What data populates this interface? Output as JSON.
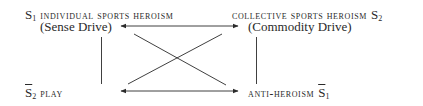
{
  "diagram": {
    "type": "semiotic-square",
    "nodes": {
      "top_left": {
        "symbol": "S",
        "subscript": "1",
        "negated": false,
        "label": "INDIVIDUAL SPORTS HEROISM",
        "sublabel": "(Sense Drive)"
      },
      "top_right": {
        "symbol": "S",
        "subscript": "2",
        "negated": false,
        "label": "COLLECTIVE SPORTS HEROISM",
        "sublabel": "(Commodity Drive)"
      },
      "bottom_left": {
        "symbol": "S",
        "subscript": "2",
        "negated": true,
        "label": "PLAY"
      },
      "bottom_right": {
        "symbol": "S",
        "subscript": "1",
        "negated": true,
        "label": "ANTI-HEROISM"
      }
    },
    "edges": [
      {
        "from": "top_left",
        "to": "top_right",
        "style": "double-arrow"
      },
      {
        "from": "bottom_left",
        "to": "bottom_right",
        "style": "double-arrow"
      },
      {
        "from": "top_left",
        "to": "bottom_left",
        "style": "line"
      },
      {
        "from": "top_right",
        "to": "bottom_right",
        "style": "line"
      },
      {
        "from": "top_left",
        "to": "bottom_right",
        "style": "line"
      },
      {
        "from": "top_right",
        "to": "bottom_left",
        "style": "line"
      }
    ],
    "colors": {
      "ink": "#2a2a2a",
      "background": "#ffffff"
    }
  }
}
